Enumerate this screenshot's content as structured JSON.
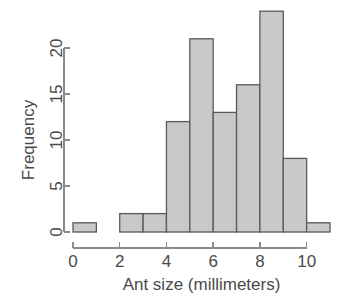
{
  "chart_data": {
    "type": "bar",
    "title": "",
    "subtitle": "",
    "xlabel": "Ant size (millimeters)",
    "ylabel": "Frequency",
    "categories": [
      "0-1",
      "1-2",
      "2-3",
      "3-4",
      "4-5",
      "5-6",
      "6-7",
      "7-8",
      "8-9",
      "9-10",
      "10-11"
    ],
    "bin_edges": [
      0,
      1,
      2,
      3,
      4,
      5,
      6,
      7,
      8,
      9,
      10,
      11
    ],
    "bin_width": 1,
    "values": [
      1,
      0,
      2,
      2,
      12,
      21,
      13,
      16,
      24,
      8,
      1
    ],
    "xlim": [
      0,
      11
    ],
    "ylim": [
      0,
      24
    ],
    "x_ticks": [
      0,
      2,
      4,
      6,
      8,
      10
    ],
    "x_tick_labels": [
      "0",
      "2",
      "4",
      "6",
      "8",
      "10"
    ],
    "y_ticks": [
      0,
      5,
      10,
      15,
      20
    ],
    "y_tick_labels": [
      "0",
      "5",
      "10",
      "15",
      "20"
    ],
    "grid": false,
    "legend": null,
    "legend_position": "none",
    "bar_fill_color": "#c9c9c9",
    "bar_border_color": "#5a5a5a",
    "axis_color": "#8a8a8a",
    "text_color": "#4a4a4a",
    "background_color": "#ffffff"
  },
  "labels": {
    "y_axis_title": "Frequency",
    "x_axis_title": "Ant size (millimeters)"
  }
}
